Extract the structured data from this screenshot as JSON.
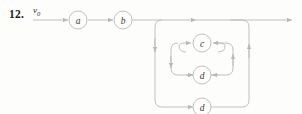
{
  "figure": {
    "problem_number": "12.",
    "input_signal_variable": "v",
    "input_signal_subscript": "0",
    "colors": {
      "line": "#b9b9b9",
      "node_stroke": "#b9b9b9",
      "node_fill": "#fdfdfc",
      "label_text": "#3a3a3a",
      "number_text": "#1d1d1d",
      "background": "#fdfdfc"
    },
    "nodes": [
      {
        "id": "node-a",
        "label": "a",
        "cx": 78,
        "cy": 20,
        "r": 9
      },
      {
        "id": "node-b",
        "label": "b",
        "cx": 123,
        "cy": 20,
        "r": 9
      },
      {
        "id": "node-c",
        "label": "c",
        "cx": 202,
        "cy": 43,
        "r": 9
      },
      {
        "id": "node-d-middle",
        "label": "d",
        "cx": 202,
        "cy": 75,
        "r": 9
      },
      {
        "id": "node-d-outer",
        "label": "d",
        "cx": 202,
        "cy": 107,
        "r": 9
      }
    ],
    "loops": [
      {
        "id": "feedback-loop-outer",
        "node": "d",
        "level": 3
      },
      {
        "id": "feedback-loop-middle",
        "node": "d",
        "level": 2
      },
      {
        "id": "feedback-loop-inner",
        "node": "c",
        "level": 1
      }
    ],
    "main_line": {
      "start_x": 33,
      "end_x": 296,
      "y": 20,
      "has_terminal_arrow": true
    }
  }
}
